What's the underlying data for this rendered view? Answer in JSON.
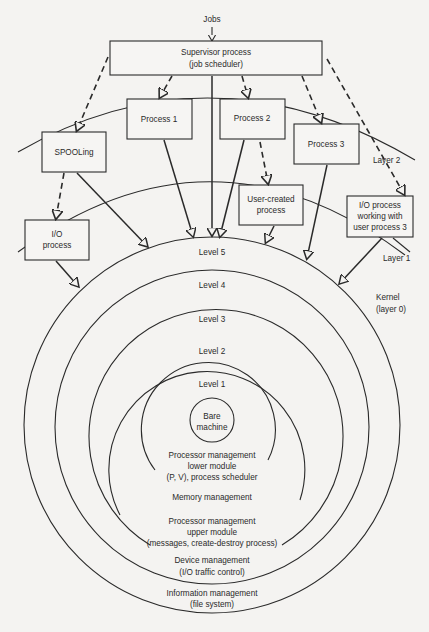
{
  "figure": {
    "inputs": {
      "jobs": "Jobs"
    },
    "boxes": {
      "supervisor": [
        "Supervisor process",
        "(job scheduler)"
      ],
      "process1": [
        "Process 1"
      ],
      "process2": [
        "Process 2"
      ],
      "process3": [
        "Process 3"
      ],
      "spooling": [
        "SPOOLing"
      ],
      "user_created": [
        "User-created",
        "process"
      ],
      "io_process": [
        "I/O",
        "process"
      ],
      "io_user3": [
        "I/O process",
        "working with",
        "user process 3"
      ]
    },
    "layers": {
      "layer2": "Layer 2",
      "layer1": "Layer 1",
      "kernel": [
        "Kernel",
        "(layer 0)"
      ]
    },
    "levels": {
      "level5": "Level 5",
      "level4": "Level 4",
      "level3": "Level 3",
      "level2": "Level 2",
      "level1": "Level 1",
      "bare": [
        "Bare",
        "machine"
      ]
    },
    "level_functions": {
      "level1": [
        "Processor management",
        "lower module",
        "(P, V), process scheduler"
      ],
      "level2": [
        "Memory management"
      ],
      "level3": [
        "Processor management",
        "upper module",
        "(messages, create-destroy process)"
      ],
      "level4": [
        "Device management",
        "(I/O traffic control)"
      ],
      "level5": [
        "Information management",
        "(file system)"
      ]
    },
    "colors": {
      "ink": "#2a2a2a",
      "paper": "#f4f3f1"
    }
  }
}
